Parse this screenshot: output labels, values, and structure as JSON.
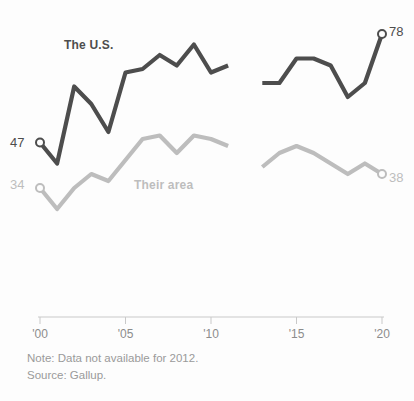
{
  "chart_data": {
    "type": "line",
    "title": "",
    "subtitle": "",
    "xlabel": "",
    "ylabel": "",
    "xlim": [
      2000,
      2020
    ],
    "ylim": [
      20,
      82
    ],
    "grid": false,
    "legend_position": "inline-labels",
    "x_ticks": [
      {
        "value": 2000,
        "label": "'00"
      },
      {
        "value": 2005,
        "label": "'05"
      },
      {
        "value": 2010,
        "label": "'10"
      },
      {
        "value": 2015,
        "label": "'15"
      },
      {
        "value": 2020,
        "label": "'20"
      }
    ],
    "series": [
      {
        "name": "The U.S.",
        "color": "#4d4d4d",
        "label_text": "The U.S.",
        "start_value": 47,
        "end_value": 78,
        "x": [
          2000,
          2001,
          2002,
          2003,
          2004,
          2005,
          2006,
          2007,
          2008,
          2009,
          2010,
          2011,
          2013,
          2014,
          2015,
          2016,
          2017,
          2018,
          2019,
          2020
        ],
        "values": [
          47,
          41,
          63,
          58,
          50,
          67,
          68,
          72,
          69,
          75,
          67,
          69,
          64,
          64,
          71,
          71,
          69,
          60,
          64,
          78
        ]
      },
      {
        "name": "Their area",
        "color": "#bdbdbd",
        "label_text": "Their area",
        "start_value": 34,
        "end_value": 38,
        "x": [
          2000,
          2001,
          2002,
          2003,
          2004,
          2005,
          2006,
          2007,
          2008,
          2009,
          2010,
          2011,
          2013,
          2014,
          2015,
          2016,
          2017,
          2018,
          2019,
          2020
        ],
        "values": [
          34,
          28,
          34,
          38,
          36,
          42,
          48,
          49,
          44,
          49,
          48,
          46,
          40,
          44,
          46,
          44,
          41,
          38,
          41,
          38
        ]
      }
    ],
    "annotations": [
      {
        "name": "left-endpoint-us",
        "text": "47"
      },
      {
        "name": "left-endpoint-their-area",
        "text": "34"
      },
      {
        "name": "right-endpoint-us",
        "text": "78"
      },
      {
        "name": "right-endpoint-their-area",
        "text": "38"
      }
    ],
    "missing_data_years": [
      2012
    ]
  },
  "labels": {
    "series_us": "The U.S.",
    "series_their_area": "Their area",
    "value_left_us": "47",
    "value_left_their_area": "34",
    "value_right_us": "78",
    "value_right_their_area": "38"
  },
  "axis": {
    "ticks": [
      "'00",
      "'05",
      "'10",
      "'15",
      "'20"
    ]
  },
  "footer": {
    "note": "Note: Data not available for 2012.",
    "source": "Source: Gallup."
  },
  "colors": {
    "us_line": "#4d4d4d",
    "their_area_line": "#bdbdbd",
    "axis": "#c9c9c9",
    "tick_text": "#8c8c8c",
    "footer_text": "#9a9a9a",
    "background": "#fdfdfd"
  }
}
